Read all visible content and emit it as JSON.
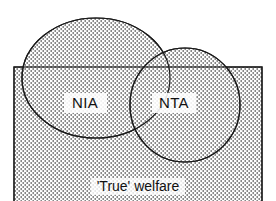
{
  "diagram": {
    "type": "venn-diagram",
    "title_visible": false,
    "universe": {
      "name": "true-welfare-rectangle",
      "label": "'True' welfare",
      "shape": "rectangle",
      "x": 14,
      "y": 67,
      "width": 248,
      "height": 134,
      "label_x": 138,
      "label_y": 186,
      "filled": true,
      "stroke_color": "#1a1a1a"
    },
    "sets": [
      {
        "name": "nia-circle",
        "label": "NIA",
        "shape": "ellipse",
        "cx": 96,
        "cy": 78,
        "rx": 74,
        "ry": 60,
        "label_x": 85,
        "label_y": 103,
        "filled": true,
        "stroke_color": "#1a1a1a"
      },
      {
        "name": "nta-circle",
        "label": "NTA",
        "shape": "ellipse",
        "cx": 185,
        "cy": 105,
        "rx": 55,
        "ry": 57,
        "label_x": 173,
        "label_y": 103,
        "filled": true,
        "stroke_color": "#1a1a1a"
      }
    ],
    "fill": {
      "pattern": "fine-vertical-dash-hatch",
      "foreground_color": "#4d4d4d",
      "background_color": "#ffffff"
    },
    "colors": {
      "stroke": "#1a1a1a",
      "text": "#111111",
      "background": "#ffffff"
    }
  }
}
